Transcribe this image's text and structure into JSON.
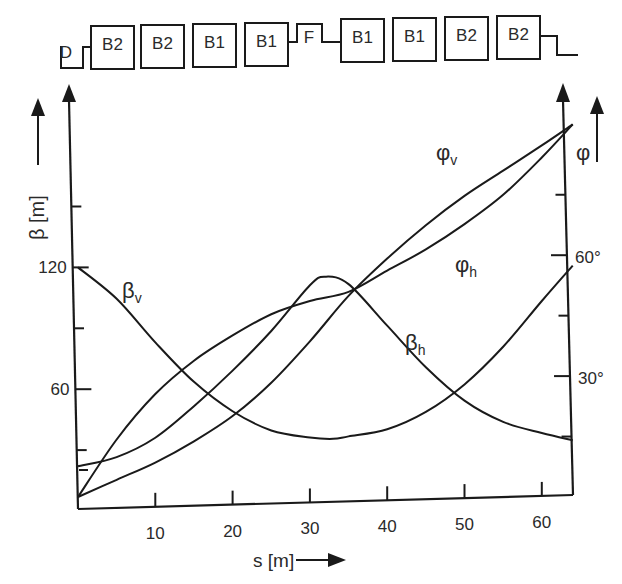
{
  "lattice": {
    "elements": [
      {
        "label": "D",
        "type": "quad"
      },
      {
        "label": "B2",
        "type": "dipole"
      },
      {
        "label": "B2",
        "type": "dipole"
      },
      {
        "label": "B1",
        "type": "dipole"
      },
      {
        "label": "B1",
        "type": "dipole"
      },
      {
        "label": "F",
        "type": "quad"
      },
      {
        "label": "B1",
        "type": "dipole"
      },
      {
        "label": "B1",
        "type": "dipole"
      },
      {
        "label": "B2",
        "type": "dipole"
      },
      {
        "label": "B2",
        "type": "dipole"
      }
    ]
  },
  "chart_data": {
    "type": "line",
    "title": "",
    "xlabel": "s [m]",
    "ylabel": "β [m]",
    "y2label": "φ",
    "xlim": [
      0,
      64
    ],
    "ylim": [
      0,
      180
    ],
    "y2lim": [
      0,
      90
    ],
    "x_ticks": [
      10,
      20,
      30,
      40,
      50,
      60
    ],
    "x_tick_labels": [
      "10",
      "20",
      "30",
      "40",
      "50",
      "60"
    ],
    "y_ticks": [
      30,
      60,
      90,
      120,
      150
    ],
    "y_tick_labels": {
      "60": "60",
      "120": "120"
    },
    "y2_ticks": [
      15,
      30,
      45,
      60,
      75
    ],
    "y2_tick_labels": {
      "30": "30°",
      "60": "60°"
    },
    "grid": false,
    "legend": "inline labels",
    "series": [
      {
        "name": "β_v",
        "label": "βv",
        "axis": "left",
        "x": [
          0,
          5,
          10,
          15,
          20,
          25,
          30,
          33,
          35,
          40,
          45,
          50,
          55,
          60,
          64
        ],
        "y": [
          120,
          104,
          82,
          62,
          47,
          37,
          33,
          32,
          33,
          36,
          44,
          57,
          75,
          97,
          114
        ]
      },
      {
        "name": "β_h",
        "label": "βh",
        "axis": "left",
        "x": [
          0,
          5,
          10,
          15,
          20,
          25,
          30,
          32,
          35,
          40,
          45,
          50,
          55,
          60,
          64
        ],
        "y": [
          22,
          26,
          35,
          50,
          67,
          86,
          108,
          112,
          108,
          87,
          66,
          49,
          38,
          32,
          28
        ]
      },
      {
        "name": "φ_v",
        "label": "φv",
        "axis": "right",
        "x": [
          0,
          5,
          10,
          15,
          20,
          25,
          30,
          35,
          40,
          45,
          50,
          55,
          60,
          64
        ],
        "y": [
          0,
          4,
          8,
          13,
          19,
          27,
          37,
          48,
          57,
          65,
          72,
          78,
          84,
          89
        ]
      },
      {
        "name": "φ_h",
        "label": "φh",
        "axis": "right",
        "x": [
          0,
          5,
          10,
          15,
          20,
          25,
          30,
          35,
          40,
          45,
          50,
          55,
          60,
          64
        ],
        "y": [
          0,
          14,
          25,
          33,
          39,
          44,
          47,
          49,
          54,
          59,
          65,
          72,
          81,
          89
        ]
      }
    ],
    "annotations": [
      {
        "text": "βv",
        "near": "s≈6"
      },
      {
        "text": "βh",
        "near": "s≈42"
      },
      {
        "text": "φv",
        "near": "s≈46"
      },
      {
        "text": "φh",
        "near": "s≈50"
      }
    ]
  }
}
